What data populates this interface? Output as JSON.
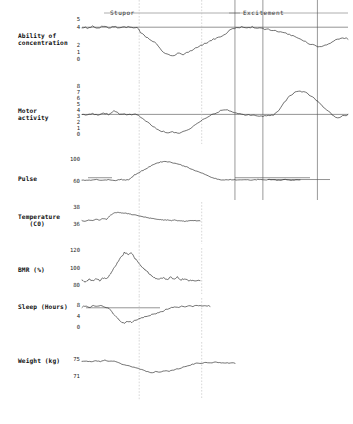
{
  "figure": {
    "title": "",
    "phases": [
      {
        "name": "stupor-phase-label",
        "label": "Stupor",
        "x_pct": 32.0
      },
      {
        "name": "excitement-phase-label",
        "label": "Excitement",
        "x_pct": 76.0
      }
    ]
  },
  "panels": [
    {
      "id": "ability-of-concentration",
      "label": "Ability of\nconcentration",
      "unit": "",
      "ticks": [
        "5",
        "4",
        "2",
        "1",
        "0"
      ],
      "tick_values": [
        5,
        4,
        2,
        1,
        0
      ],
      "ylim": [
        0,
        5
      ]
    },
    {
      "id": "motor-activity",
      "label": "Motor\nactivity",
      "unit": "",
      "ticks": [
        "8",
        "7",
        "6",
        "5",
        "4",
        "3",
        "2",
        "1",
        "0"
      ],
      "tick_values": [
        8,
        7,
        6,
        5,
        4,
        3,
        2,
        1,
        0
      ],
      "ylim": [
        0,
        8
      ]
    },
    {
      "id": "pulse",
      "label": "Pulse",
      "unit": "",
      "ticks": [
        "100",
        "60"
      ],
      "tick_values": [
        100,
        60
      ],
      "ylim": [
        52,
        110
      ]
    },
    {
      "id": "temperature",
      "label": "Temperature\n   (C0)",
      "unit": "C0",
      "ticks": [
        "38",
        "36"
      ],
      "tick_values": [
        38,
        36
      ],
      "ylim": [
        35.4,
        38.4
      ]
    },
    {
      "id": "bmr",
      "label": "BMR (%)",
      "unit": "%",
      "ticks": [
        "120",
        "100",
        "80"
      ],
      "tick_values": [
        120,
        100,
        80
      ],
      "ylim": [
        72,
        126
      ]
    },
    {
      "id": "sleep",
      "label": "Sleep (Hours)",
      "unit": "Hours",
      "ticks": [
        "8",
        "4",
        "0"
      ],
      "tick_values": [
        8,
        4,
        0
      ],
      "ylim": [
        0,
        9.5
      ]
    },
    {
      "id": "weight",
      "label": "Weight (kg)",
      "unit": "kg",
      "ticks": [
        "75",
        "71"
      ],
      "tick_values": [
        75,
        71
      ],
      "ylim": [
        70.2,
        75.8
      ]
    }
  ],
  "chart_data": {
    "type": "line",
    "title": "",
    "subtitle": "",
    "xlabel": "",
    "ylabel": "",
    "grid": false,
    "legend": "none",
    "annotations": [
      "Stupor",
      "Excitement"
    ],
    "phase_markers": {
      "stupor_span_pct": [
        21.0,
        45.0
      ],
      "excitement_span_pct": [
        56.0,
        95.0
      ],
      "vertical_lines_pct": [
        21.5,
        45.0,
        57.5,
        68.0,
        88.5
      ],
      "vertical_line_styles": [
        "faint",
        "faint",
        "solid",
        "solid",
        "solid"
      ]
    },
    "series": [
      {
        "name": "Ability of concentration",
        "ylim": [
          0,
          5
        ],
        "yticks": [
          5,
          4,
          2,
          1,
          0
        ],
        "x": [
          0,
          2,
          4,
          6,
          8,
          10,
          12,
          14,
          16,
          18,
          20,
          21,
          22,
          24,
          26,
          28,
          30,
          32,
          34,
          36,
          38,
          40,
          42,
          44,
          45,
          46,
          48,
          50,
          52,
          54,
          56,
          58,
          60,
          62,
          64,
          66,
          68,
          70,
          72,
          74,
          76,
          78,
          80,
          82,
          84,
          86,
          88,
          89,
          90,
          92,
          94,
          96,
          98,
          100
        ],
        "y": [
          4.0,
          3.9,
          4.1,
          3.9,
          4.1,
          3.9,
          4.1,
          3.9,
          4.0,
          4.0,
          4.0,
          3.9,
          3.4,
          2.8,
          2.4,
          2.0,
          1.1,
          0.7,
          0.5,
          0.8,
          0.7,
          1.0,
          1.3,
          1.6,
          1.8,
          2.0,
          2.3,
          2.6,
          2.9,
          3.2,
          3.8,
          3.9,
          4.0,
          3.9,
          4.0,
          3.9,
          3.8,
          3.8,
          3.6,
          3.5,
          3.3,
          3.1,
          2.8,
          2.5,
          2.2,
          1.9,
          1.7,
          1.6,
          1.7,
          1.9,
          2.2,
          2.5,
          2.7,
          2.6
        ]
      },
      {
        "name": "Motor activity",
        "ylim": [
          0,
          8
        ],
        "yticks": [
          8,
          7,
          6,
          5,
          4,
          3,
          2,
          1,
          0
        ],
        "x": [
          0,
          2,
          4,
          6,
          8,
          10,
          12,
          14,
          16,
          18,
          20,
          21,
          22,
          24,
          26,
          28,
          30,
          32,
          34,
          36,
          38,
          40,
          42,
          44,
          46,
          48,
          50,
          52,
          54,
          56,
          58,
          60,
          62,
          64,
          66,
          68,
          70,
          72,
          74,
          76,
          78,
          80,
          82,
          84,
          86,
          88,
          90,
          92,
          94,
          96,
          98,
          100
        ],
        "y": [
          3.3,
          3.2,
          3.4,
          3.2,
          3.5,
          3.3,
          3.9,
          3.4,
          3.3,
          3.3,
          3.3,
          3.3,
          2.9,
          2.2,
          1.6,
          1.0,
          0.6,
          0.4,
          0.5,
          0.3,
          0.5,
          0.9,
          1.4,
          2.0,
          2.6,
          3.1,
          3.4,
          3.9,
          4.1,
          3.8,
          3.5,
          3.3,
          3.2,
          3.2,
          3.1,
          3.0,
          3.1,
          3.2,
          4.0,
          5.2,
          6.2,
          6.8,
          7.0,
          6.8,
          6.3,
          5.6,
          4.8,
          4.0,
          3.3,
          2.7,
          3.1,
          3.2
        ]
      },
      {
        "name": "Pulse",
        "ylim": [
          52,
          110
        ],
        "yticks": [
          100,
          60
        ],
        "x": [
          0,
          3,
          6,
          9,
          12,
          15,
          18,
          21,
          22,
          24,
          27,
          30,
          33,
          36,
          39,
          42,
          45,
          48,
          51,
          54,
          57,
          60,
          63,
          66,
          69,
          72,
          75,
          78,
          81,
          84,
          87,
          90,
          93,
          96,
          100
        ],
        "y": [
          61,
          60,
          62,
          60,
          62,
          60,
          62,
          61,
          63,
          72,
          80,
          88,
          96,
          101,
          102,
          99,
          95,
          90,
          84,
          78,
          72,
          66,
          62,
          61,
          62,
          61,
          62,
          61,
          62,
          61,
          62,
          60,
          62,
          60,
          61
        ]
      },
      {
        "name": "Temperature",
        "ylim": [
          35.4,
          38.4
        ],
        "yticks": [
          38,
          36
        ],
        "x": [
          0,
          3,
          6,
          9,
          12,
          15,
          18,
          21,
          24,
          27,
          30,
          33,
          36,
          39,
          42,
          45,
          48,
          51,
          54,
          57,
          60,
          63,
          66,
          69,
          72,
          75,
          78,
          81,
          84,
          87,
          90
        ],
        "y": [
          36.3,
          36.2,
          36.4,
          36.3,
          36.5,
          36.4,
          36.6,
          36.5,
          37.1,
          37.4,
          37.5,
          37.4,
          37.4,
          37.3,
          37.2,
          37.1,
          37.0,
          36.9,
          36.8,
          36.7,
          36.6,
          36.5,
          36.5,
          36.4,
          36.4,
          36.3,
          36.4,
          36.3,
          36.3,
          36.2,
          36.3
        ]
      },
      {
        "name": "BMR",
        "ylim": [
          72,
          126
        ],
        "yticks": [
          120,
          100,
          80
        ],
        "x": [
          0,
          3,
          6,
          9,
          12,
          15,
          18,
          21,
          24,
          27,
          30,
          33,
          36,
          39,
          42,
          45,
          48,
          51,
          54,
          57,
          60,
          63,
          66,
          69,
          72,
          75,
          78,
          81,
          84,
          87,
          90
        ],
        "y": [
          80,
          78,
          82,
          79,
          83,
          80,
          84,
          82,
          90,
          98,
          106,
          114,
          121,
          118,
          120,
          112,
          106,
          100,
          95,
          90,
          86,
          83,
          82,
          84,
          81,
          85,
          82,
          85,
          81,
          83,
          80
        ]
      },
      {
        "name": "Sleep",
        "ylim": [
          0,
          9.5
        ],
        "yticks": [
          8,
          4,
          0
        ],
        "x": [
          0,
          3,
          6,
          9,
          12,
          15,
          18,
          21,
          24,
          27,
          30,
          33,
          36,
          39,
          42,
          45,
          48,
          51,
          54,
          57,
          60,
          63,
          66,
          69,
          72,
          75,
          78,
          81,
          84,
          87,
          90,
          93
        ],
        "y": [
          8.3,
          8.8,
          8.2,
          9.0,
          8.4,
          9.1,
          8.3,
          8.0,
          5.8,
          4.2,
          2.6,
          1.9,
          2.8,
          2.1,
          3.2,
          3.6,
          4.2,
          4.6,
          5.2,
          5.6,
          6.2,
          6.6,
          7.4,
          7.9,
          8.4,
          8.0,
          8.6,
          8.2,
          8.8,
          8.6,
          9.1,
          8.7
        ]
      },
      {
        "name": "Weight",
        "ylim": [
          70.2,
          75.8
        ],
        "yticks": [
          75,
          71
        ],
        "x": [
          0,
          3,
          6,
          9,
          12,
          15,
          18,
          21,
          24,
          27,
          30,
          33,
          36,
          39,
          42,
          45,
          48,
          51,
          54,
          57,
          60,
          63,
          66,
          69,
          72,
          75,
          78,
          81,
          84,
          87,
          90,
          93
        ],
        "y": [
          74.8,
          75.0,
          74.7,
          75.1,
          74.8,
          75.2,
          74.9,
          75.0,
          74.4,
          74.0,
          73.6,
          73.3,
          73.0,
          72.5,
          72.1,
          71.6,
          72.0,
          71.8,
          72.2,
          72.1,
          72.5,
          72.8,
          73.2,
          73.6,
          74.0,
          74.4,
          74.3,
          74.6,
          74.4,
          74.7,
          74.5,
          74.4
        ]
      }
    ]
  }
}
